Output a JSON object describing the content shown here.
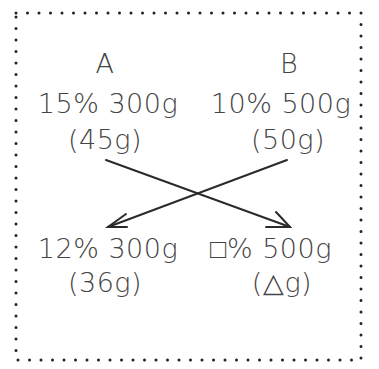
{
  "diagram": {
    "type": "concentration-mixing-cross-diagram",
    "border": {
      "style": "dotted",
      "color": "#222222"
    },
    "top_left": {
      "label": "A",
      "concentration": "15%",
      "mass": "300g",
      "solute": "(45g)"
    },
    "top_right": {
      "label": "B",
      "concentration": "10%",
      "mass": "500g",
      "solute": "(50g)"
    },
    "bottom_left": {
      "concentration": "12%",
      "mass": "300g",
      "solute": "(36g)"
    },
    "bottom_right": {
      "concentration_symbol": "□",
      "concentration": "□%",
      "mass": "500g",
      "solute_symbol": "△",
      "solute": "(△g)"
    },
    "arrows": [
      {
        "from": "top_left",
        "to": "bottom_right"
      },
      {
        "from": "top_right",
        "to": "bottom_left"
      }
    ],
    "line_color": "#2a2a2a"
  }
}
